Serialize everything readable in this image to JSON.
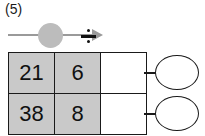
{
  "exercise": {
    "number_label": "(5)"
  },
  "operation": {
    "symbol": "÷",
    "symbol_name": "division-sign",
    "arrow_name": "rightward-arrow",
    "badge_color": "#bcbcbc",
    "arrow_color": "#9a9a9a"
  },
  "table": {
    "shaded_cell_color": "#c9c9c9",
    "empty_cell_color": "#ffffff",
    "border_color": "#1a1a1a",
    "rows": [
      {
        "dividend": "21",
        "divisor": "6",
        "quotient": ""
      },
      {
        "dividend": "38",
        "divisor": "8",
        "quotient": ""
      }
    ]
  },
  "answers": [
    {
      "value": ""
    },
    {
      "value": ""
    }
  ]
}
